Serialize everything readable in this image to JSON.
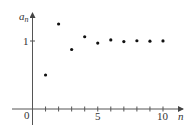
{
  "chart_data": {
    "type": "scatter",
    "title": "",
    "xlabel": "n",
    "ylabel": "a_n",
    "ylabel_main": "a",
    "ylabel_sub": "n",
    "x": [
      1,
      2,
      3,
      4,
      5,
      6,
      7,
      8,
      9,
      10
    ],
    "values": [
      0.5,
      1.25,
      0.875,
      1.0625,
      0.969,
      1.016,
      0.992,
      1.004,
      0.998,
      1.001
    ],
    "x_ticks": [
      1,
      2,
      3,
      4,
      5,
      6,
      7,
      8,
      9,
      10
    ],
    "x_tick_labels": [
      "0",
      "5",
      "10"
    ],
    "y_ticks": [
      1
    ],
    "y_tick_labels": [
      "1"
    ],
    "xlim": [
      -1.5,
      11.5
    ],
    "ylim": [
      -0.25,
      1.4
    ],
    "grid": false,
    "legend": null,
    "marker_color": "#111111",
    "axis_color": "#555555"
  }
}
